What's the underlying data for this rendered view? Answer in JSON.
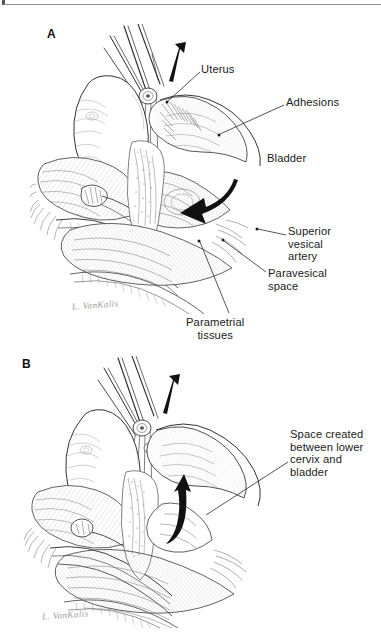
{
  "figure": {
    "type": "medical-illustration",
    "technique": "pen-and-ink line drawing",
    "background_color": "#ffffff",
    "ink_color": "#1b1b1b",
    "panel_count": 2
  },
  "panels": [
    {
      "letter": "A",
      "caption_labels": [
        "Uterus",
        "Adhesions",
        "Bladder",
        "Superior\nvesical\nartery",
        "Paravesical\nspace",
        "Parametrial\ntissues"
      ],
      "arrows": [
        {
          "name": "traction-arrow",
          "style": "solid-black-straight",
          "direction": "up"
        },
        {
          "name": "dissection-arrow",
          "style": "solid-black-curved",
          "direction": "left"
        }
      ],
      "signature": "L. VanKalis"
    },
    {
      "letter": "B",
      "caption_labels": [
        "Space created\nbetween lower\ncervix and\nbladder"
      ],
      "arrows": [
        {
          "name": "traction-arrow",
          "style": "solid-black-straight",
          "direction": "up"
        },
        {
          "name": "space-arrow",
          "style": "solid-black-hooked",
          "direction": "up"
        }
      ],
      "signature": "L. VanKalis"
    }
  ],
  "labels": {
    "panel_a_letter": "A",
    "panel_b_letter": "B",
    "uterus": "Uterus",
    "adhesions": "Adhesions",
    "bladder": "Bladder",
    "superior_vesical_artery": "Superior\nvesical\nartery",
    "paravesical_space": "Paravesical\nspace",
    "parametrial_tissues": "Parametrial\ntissues",
    "space_created": "Space created\nbetween lower\ncervix and\nbladder"
  },
  "signatures": {
    "panel_a": "L. VanKalis",
    "panel_b": "L. VanKalis"
  }
}
